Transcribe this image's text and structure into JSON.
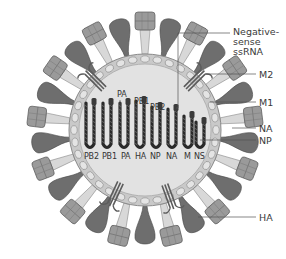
{
  "colors": {
    "spike_dark": "#6e6e6e",
    "spike_mid": "#9a9a9a",
    "spike_light": "#d8d8d8",
    "membrane": "#bdbdbd",
    "bead": "#e4e4e4",
    "interior": "#dedede",
    "rna": "#2a2a2a",
    "leader": "#555555"
  },
  "labels": {
    "negative_sense_ssrna": [
      "Negative-",
      "sense",
      "ssRNA"
    ],
    "m2": "M2",
    "m1": "M1",
    "na": "NA",
    "np": "NP",
    "ha": "HA"
  },
  "segments": [
    "PB2",
    "PB1",
    "PA",
    "HA",
    "NP",
    "NA",
    "M",
    "NS"
  ],
  "polymerase_subunits": [
    "PA",
    "PB1",
    "PB2"
  ]
}
